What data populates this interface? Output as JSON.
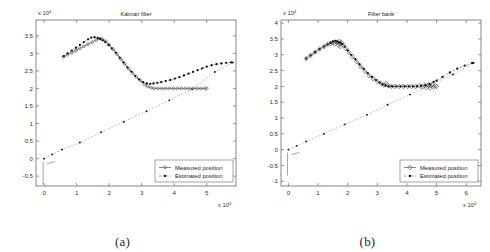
{
  "figure": {
    "panels": [
      {
        "id": "a",
        "caption": "(a)",
        "title": "Kalman filter",
        "x_exponent_label": "x 10",
        "x_exponent_sup": "4",
        "y_exponent_label": "x 10",
        "y_exponent_sup": "4",
        "legend": {
          "measured": "Measured position",
          "estimated": "Estimated position"
        }
      },
      {
        "id": "b",
        "caption": "(b)",
        "title": "Filter bank",
        "x_exponent_label": "x 10",
        "x_exponent_sup": "4",
        "y_exponent_label": "x 10",
        "y_exponent_sup": "4",
        "legend": {
          "measured": "Measured position",
          "estimated": "Estimated position"
        }
      }
    ]
  },
  "chart_data": [
    {
      "type": "scatter",
      "panel": "a",
      "title": "Kalman filter",
      "xlabel": "x 10^4",
      "ylabel": "x 10^4",
      "xlim": [
        -0.25,
        5.9
      ],
      "ylim": [
        -0.78,
        3.95
      ],
      "xticks": [
        "0",
        "1",
        "2",
        "3",
        "4",
        "5"
      ],
      "xtick_values": [
        0,
        1,
        2,
        3,
        4,
        5
      ],
      "yticks": [
        "-0.5",
        "0",
        "0.5",
        "1",
        "1.5",
        "2",
        "2.5",
        "3",
        "3.5"
      ],
      "ytick_values": [
        -0.5,
        0,
        0.5,
        1,
        1.5,
        2,
        2.5,
        3,
        3.5
      ],
      "grid": false,
      "legend_position": "lower right",
      "legend_entries": [
        "Measured position",
        "Estimated position"
      ],
      "series": [
        {
          "name": "Measured position",
          "marker": "circle",
          "linestyle": "solid",
          "x": [
            0.6,
            0.72,
            0.85,
            0.98,
            1.1,
            1.22,
            1.35,
            1.48,
            1.6,
            1.72,
            1.8,
            1.9,
            2.0,
            2.12,
            2.24,
            2.36,
            2.48,
            2.6,
            2.72,
            2.84,
            2.96,
            3.08,
            3.18,
            3.28,
            3.38,
            3.5,
            3.62,
            3.74,
            3.86,
            3.98,
            4.1,
            4.22,
            4.34,
            4.46,
            4.58,
            4.7,
            4.82,
            4.94,
            5.0
          ],
          "y": [
            2.9,
            2.96,
            3.02,
            3.08,
            3.14,
            3.2,
            3.26,
            3.32,
            3.38,
            3.42,
            3.4,
            3.34,
            3.24,
            3.12,
            2.98,
            2.84,
            2.7,
            2.56,
            2.44,
            2.32,
            2.22,
            2.12,
            2.06,
            2.02,
            2.0,
            2.0,
            2.0,
            2.0,
            2.0,
            2.0,
            2.0,
            2.0,
            2.0,
            2.0,
            2.0,
            2.0,
            2.0,
            2.0,
            2.0
          ]
        },
        {
          "name": "Estimated position",
          "marker": "dot",
          "linestyle": "dashed",
          "x": [
            0.6,
            0.72,
            0.85,
            0.98,
            1.1,
            1.22,
            1.35,
            1.45,
            1.55,
            1.65,
            1.72,
            1.8,
            1.88,
            1.98,
            2.08,
            2.2,
            2.32,
            2.44,
            2.56,
            2.68,
            2.8,
            2.92,
            3.04,
            3.16,
            3.26,
            3.36,
            3.48,
            3.6,
            3.74,
            3.88,
            4.02,
            4.16,
            4.3,
            4.44,
            4.58,
            4.72,
            4.86,
            5.0,
            5.15,
            5.3,
            5.45,
            5.6,
            5.75
          ],
          "y": [
            2.92,
            3.0,
            3.08,
            3.16,
            3.24,
            3.32,
            3.4,
            3.45,
            3.46,
            3.44,
            3.41,
            3.37,
            3.32,
            3.24,
            3.14,
            3.02,
            2.88,
            2.74,
            2.6,
            2.48,
            2.36,
            2.26,
            2.18,
            2.14,
            2.13,
            2.14,
            2.16,
            2.18,
            2.21,
            2.24,
            2.28,
            2.32,
            2.37,
            2.42,
            2.47,
            2.52,
            2.57,
            2.62,
            2.66,
            2.69,
            2.71,
            2.73,
            2.74
          ]
        },
        {
          "name": "Reference ramp",
          "marker": "dot-sparse",
          "linestyle": "dashed",
          "x": [
            0.0,
            0.25,
            0.55,
            1.1,
            1.75,
            2.45,
            3.15,
            3.85,
            4.55,
            5.25,
            5.8
          ],
          "y": [
            0.0,
            0.12,
            0.26,
            0.46,
            0.75,
            1.05,
            1.35,
            1.66,
            1.98,
            2.47,
            2.74
          ]
        }
      ]
    },
    {
      "type": "scatter",
      "panel": "b",
      "title": "Filter bank",
      "xlabel": "x 10^4",
      "ylabel": "x 10^4",
      "xlim": [
        -0.25,
        6.5
      ],
      "ylim": [
        -1.15,
        4.1
      ],
      "xticks": [
        "0",
        "1",
        "2",
        "3",
        "4",
        "5",
        "6"
      ],
      "xtick_values": [
        0,
        1,
        2,
        3,
        4,
        5,
        6
      ],
      "yticks": [
        "-1",
        "-0.5",
        "0",
        "0.5",
        "1",
        "1.5",
        "2",
        "2.5",
        "3",
        "3.5",
        "4"
      ],
      "ytick_values": [
        -1,
        -0.5,
        0,
        0.5,
        1,
        1.5,
        2,
        2.5,
        3,
        3.5,
        4
      ],
      "grid": false,
      "legend_position": "lower right",
      "legend_entries": [
        "Measured position",
        "Estimated position"
      ],
      "series": [
        {
          "name": "Measured position",
          "marker": "diamond",
          "linestyle": "solid",
          "x": [
            0.6,
            0.75,
            0.9,
            1.05,
            1.2,
            1.32,
            1.42,
            1.5,
            1.56,
            1.62,
            1.68,
            1.72,
            1.76,
            1.8,
            1.86,
            1.94,
            2.04,
            2.16,
            2.3,
            2.44,
            2.58,
            2.72,
            2.86,
            3.0,
            3.12,
            3.22,
            3.3,
            3.38,
            3.48,
            3.6,
            3.74,
            3.88,
            4.02,
            4.16,
            4.3,
            4.42,
            4.52,
            4.6,
            4.66,
            4.72,
            4.78,
            4.84,
            4.9,
            4.96,
            5.0
          ],
          "y": [
            2.88,
            2.98,
            3.08,
            3.18,
            3.26,
            3.32,
            3.36,
            3.38,
            3.34,
            3.4,
            3.3,
            3.42,
            3.26,
            3.38,
            3.3,
            3.2,
            3.08,
            2.94,
            2.78,
            2.62,
            2.48,
            2.34,
            2.24,
            2.16,
            2.1,
            2.04,
            2.1,
            2.02,
            2.0,
            2.0,
            2.0,
            2.0,
            2.0,
            2.0,
            2.0,
            2.02,
            1.98,
            2.04,
            1.96,
            2.05,
            1.95,
            2.04,
            1.97,
            2.02,
            2.0
          ]
        },
        {
          "name": "Estimated position",
          "marker": "dot",
          "linestyle": "dashed",
          "x": [
            0.6,
            0.75,
            0.9,
            1.05,
            1.2,
            1.32,
            1.42,
            1.5,
            1.58,
            1.64,
            1.7,
            1.76,
            1.82,
            1.9,
            2.0,
            2.12,
            2.26,
            2.4,
            2.54,
            2.68,
            2.82,
            2.96,
            3.08,
            3.18,
            3.28,
            3.38,
            3.5,
            3.64,
            3.78,
            3.92,
            4.06,
            4.2,
            4.34,
            4.48,
            4.62,
            4.76,
            4.9,
            5.0,
            5.2,
            5.45,
            5.7,
            5.95,
            6.2
          ],
          "y": [
            2.88,
            2.98,
            3.08,
            3.18,
            3.26,
            3.33,
            3.38,
            3.42,
            3.44,
            3.42,
            3.4,
            3.38,
            3.34,
            3.26,
            3.14,
            3.0,
            2.86,
            2.7,
            2.56,
            2.42,
            2.3,
            2.2,
            2.12,
            2.06,
            2.02,
            2.0,
            2.0,
            2.0,
            2.0,
            2.0,
            2.0,
            2.0,
            2.0,
            2.02,
            2.04,
            2.08,
            2.14,
            2.18,
            2.3,
            2.44,
            2.56,
            2.66,
            2.74
          ]
        },
        {
          "name": "Reference ramp",
          "marker": "dot-sparse",
          "linestyle": "dashed",
          "x": [
            0.0,
            0.28,
            0.6,
            1.2,
            1.9,
            2.65,
            3.35,
            4.1,
            4.8,
            5.55,
            6.25
          ],
          "y": [
            0.0,
            0.12,
            0.26,
            0.5,
            0.8,
            1.1,
            1.42,
            1.74,
            2.05,
            2.38,
            2.74
          ]
        }
      ]
    }
  ]
}
